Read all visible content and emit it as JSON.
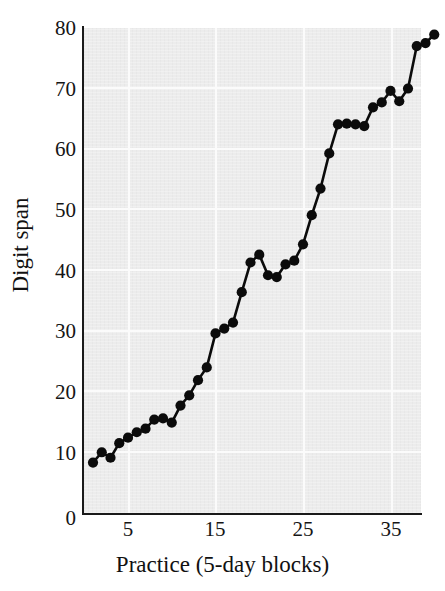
{
  "chart_data": {
    "type": "line",
    "title": "",
    "subtitle": "",
    "xlabel": "Practice (5-day blocks)",
    "ylabel": "Digit span",
    "xlim": [
      0,
      39
    ],
    "ylim": [
      0,
      80
    ],
    "xticks": [
      5,
      15,
      25,
      35
    ],
    "yticks": [
      0,
      10,
      20,
      30,
      40,
      50,
      60,
      70,
      80
    ],
    "grid": true,
    "legend": "none",
    "marker": "filled-circle",
    "series": [
      {
        "name": "Digit span",
        "x": [
          1,
          2,
          3,
          4,
          5,
          6,
          7,
          8,
          9,
          10,
          11,
          12,
          13,
          14,
          15,
          16,
          17,
          18,
          19,
          20,
          21,
          22,
          23,
          24,
          25,
          26,
          27,
          28,
          29,
          30,
          31,
          32,
          33,
          34,
          35,
          36,
          37,
          38
        ],
        "values": [
          8.4,
          10.1,
          9.2,
          11.6,
          12.5,
          13.4,
          14.0,
          15.5,
          15.7,
          15.0,
          17.8,
          19.5,
          22.0,
          24.1,
          29.7,
          30.5,
          31.5,
          36.5,
          41.4,
          42.7,
          39.3,
          39.0,
          41.1,
          41.7,
          44.4,
          49.2,
          53.6,
          59.4,
          64.2,
          64.3,
          64.2,
          63.9,
          67.0,
          67.8,
          69.7,
          68.0,
          70.1,
          77.1
        ]
      }
    ],
    "extra_points": {
      "note": "",
      "x": [
        39,
        40
      ],
      "values": [
        77.6,
        79.0
      ]
    }
  },
  "axis": {
    "y_tick_labels": [
      "80",
      "70",
      "60",
      "50",
      "40",
      "30",
      "20",
      "10",
      "0"
    ],
    "x_tick_labels": [
      "5",
      "15",
      "25",
      "35"
    ],
    "y_title": "Digit span",
    "x_title": "Practice (5-day blocks)"
  },
  "colors": {
    "plot_background": "#ececec",
    "grid": "#fbfbfb",
    "axis": "#1a1a1a",
    "data": "#0b0b0b",
    "page_background": "#ffffff"
  }
}
